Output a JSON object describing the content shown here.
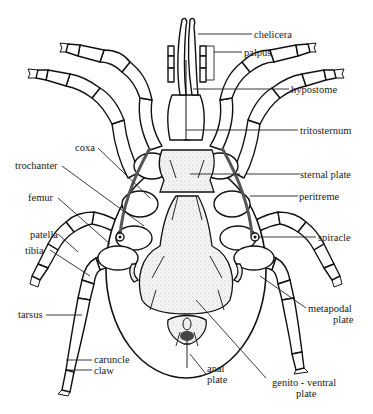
{
  "diagram": {
    "labels": {
      "chelicera": "chelicera",
      "palpus": "palpus",
      "hypostome": "hypostome",
      "tritosternum": "tritosternum",
      "sternal_plate": "sternal plate",
      "peritreme": "peritreme",
      "spiracle": "spiracle",
      "coxa": "coxa",
      "trochanter": "trochanter",
      "femur": "femur",
      "patella": "patella",
      "tibia": "tibia",
      "tarsus": "tarsus",
      "caruncle": "caruncle",
      "claw": "claw",
      "metapodal_plate_line1": "metapodal",
      "metapodal_plate_line2": "plate",
      "anal_plate_line1": "anal",
      "anal_plate_line2": "plate",
      "genito_ventral_plate_line1": "genito - ventral",
      "genito_ventral_plate_line2": "plate"
    },
    "colors": {
      "ink": "#111111",
      "background": "#ffffff"
    }
  }
}
